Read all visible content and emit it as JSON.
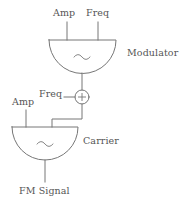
{
  "diagram": {
    "stroke_color": "#777777",
    "text_color": "#555555",
    "background_color": "#ffffff",
    "modulator": {
      "name": "Modulator",
      "label": "Modulator",
      "waveform_symbol": "~",
      "inputs": [
        {
          "label": "Amp",
          "side": "top-left"
        },
        {
          "label": "Freq",
          "side": "top-right"
        }
      ]
    },
    "sum_node": {
      "symbol": "+",
      "input_label": "Freq"
    },
    "carrier": {
      "name": "Carrier",
      "label": "Carrier",
      "waveform_symbol": "~",
      "inputs": [
        {
          "label": "Amp",
          "side": "top-left"
        },
        {
          "label": "Freq",
          "side": "top-right"
        }
      ]
    },
    "output": {
      "label": "FM Signal"
    }
  }
}
